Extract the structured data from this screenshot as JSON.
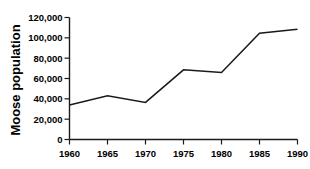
{
  "chart_data": {
    "type": "line",
    "title": "",
    "subtitle": "",
    "xlabel": "",
    "ylabel": "Moose population",
    "x": [
      1960,
      1965,
      1970,
      1975,
      1980,
      1985,
      1990
    ],
    "xtick_labels": [
      "1960",
      "1965",
      "1970",
      "1975",
      "1980",
      "1985",
      "1990"
    ],
    "values": [
      34000,
      43000,
      36500,
      68500,
      66000,
      104500,
      108500
    ],
    "series": [
      {
        "name": "Moose population",
        "values": [
          34000,
          43000,
          36500,
          68500,
          66000,
          104500,
          108500
        ]
      }
    ],
    "ytick_values": [
      0,
      20000,
      40000,
      60000,
      80000,
      100000,
      120000
    ],
    "ytick_labels": [
      "0",
      "20,000",
      "40,000",
      "60,000",
      "80,000",
      "100,000",
      "120,000"
    ],
    "xlim": [
      1960,
      1990
    ],
    "ylim": [
      0,
      120000
    ],
    "grid": false,
    "legend": false,
    "legend_position": "none",
    "line_color": "#1a1a1a",
    "background_color": "#ffffff"
  }
}
